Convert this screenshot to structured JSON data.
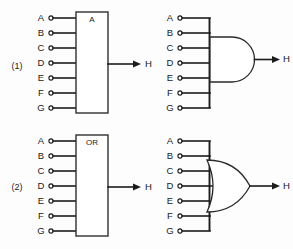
{
  "figure": {
    "background_color": "#fdfdfd",
    "line_color": "#1c1c1c",
    "rows": [
      {
        "number": "(1)",
        "block_label": "A",
        "gate_type": "AND",
        "inputs": [
          "A",
          "B",
          "C",
          "D",
          "E",
          "F",
          "G"
        ],
        "output": "H"
      },
      {
        "number": "(2)",
        "block_label": "OR",
        "gate_type": "OR",
        "inputs": [
          "A",
          "B",
          "C",
          "D",
          "E",
          "F",
          "G"
        ],
        "output": "H"
      }
    ]
  },
  "row1": {
    "number": "(1)",
    "block_label": "A",
    "output": "H",
    "output_right": "H",
    "pins": [
      {
        "label": "A"
      },
      {
        "label": "B"
      },
      {
        "label": "C"
      },
      {
        "label": "D"
      },
      {
        "label": "E"
      },
      {
        "label": "F"
      },
      {
        "label": "G"
      }
    ],
    "pins_right": [
      {
        "label": "A"
      },
      {
        "label": "B"
      },
      {
        "label": "C"
      },
      {
        "label": "D"
      },
      {
        "label": "E"
      },
      {
        "label": "F"
      },
      {
        "label": "G"
      }
    ]
  },
  "row2": {
    "number": "(2)",
    "block_label": "OR",
    "output": "H",
    "output_right": "H",
    "pins": [
      {
        "label": "A"
      },
      {
        "label": "B"
      },
      {
        "label": "C"
      },
      {
        "label": "D"
      },
      {
        "label": "E"
      },
      {
        "label": "F"
      },
      {
        "label": "G"
      }
    ],
    "pins_right": [
      {
        "label": "A"
      },
      {
        "label": "B"
      },
      {
        "label": "C"
      },
      {
        "label": "D"
      },
      {
        "label": "E"
      },
      {
        "label": "F"
      },
      {
        "label": "G"
      }
    ]
  }
}
